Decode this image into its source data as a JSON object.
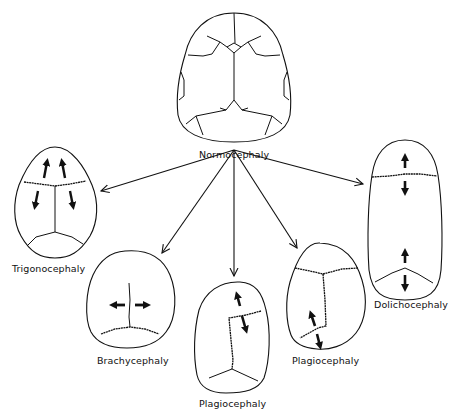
{
  "diagram": {
    "type": "skull-shape-classification",
    "center": {
      "label": "Normocephaly"
    },
    "variants": [
      {
        "id": "trigonocephaly",
        "label": "Trigonocephaly"
      },
      {
        "id": "brachycephaly",
        "label": "Brachycephaly"
      },
      {
        "id": "plagiocephaly-frontal",
        "label": "Plagiocephaly"
      },
      {
        "id": "plagiocephaly-occipital",
        "label": "Plagiocephaly"
      },
      {
        "id": "dolichocephaly",
        "label": "Dolichocephaly"
      }
    ],
    "colors": {
      "line": "#111111",
      "background": "#ffffff"
    }
  }
}
